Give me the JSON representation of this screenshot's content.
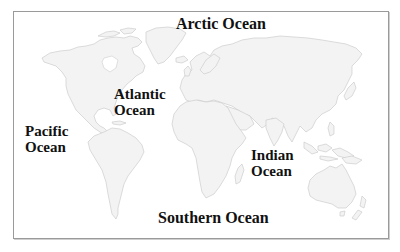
{
  "map": {
    "type": "world outline map",
    "frame_color": "#9a9a9a",
    "land_fill": "#f3f3f3",
    "land_stroke": "#cdcdcd",
    "label_color": "#111111"
  },
  "labels": {
    "arctic": {
      "line1": "Arctic Ocean"
    },
    "atlantic": {
      "line1": "Atlantic",
      "line2": "Ocean"
    },
    "pacific": {
      "line1": "Pacific",
      "line2": "Ocean"
    },
    "indian": {
      "line1": "Indian",
      "line2": "Ocean"
    },
    "southern": {
      "line1": "Southern Ocean"
    }
  },
  "continents": [
    "North America",
    "Greenland",
    "South America",
    "Europe",
    "Asia",
    "Africa",
    "Australia"
  ]
}
